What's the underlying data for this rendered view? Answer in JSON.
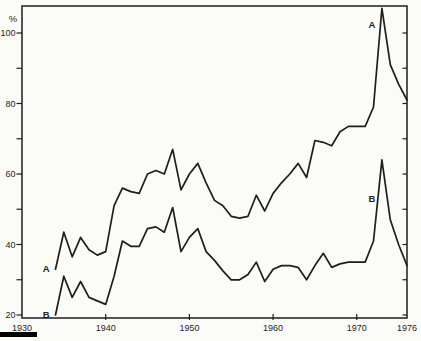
{
  "figure": {
    "background_color": "#fbfbf8",
    "ink_color": "#1e1e1e"
  },
  "chart_data": {
    "type": "line",
    "title": "",
    "xlabel": "",
    "ylabel": "%",
    "grid": false,
    "legend_position": "inline letters at series start and near 1973 peak",
    "x_axis": {
      "min": 1930,
      "max": 1976,
      "labeled_ticks": [
        1930,
        1940,
        1950,
        1960,
        1970,
        1976
      ],
      "tick_marks": [
        1940,
        1950,
        1960,
        1970
      ]
    },
    "y_axis": {
      "min": 20,
      "max": 107,
      "unit": "%",
      "labeled_ticks": [
        20,
        40,
        60,
        80,
        100
      ],
      "tick_marks": [
        20,
        30,
        40,
        50,
        60,
        70,
        80,
        90,
        100
      ]
    },
    "series": [
      {
        "name": "A",
        "color": "#1e1e1e",
        "annotations": [
          {
            "text": "A",
            "year": 1932.9,
            "value": 32.2
          },
          {
            "text": "A",
            "year": 1971.8,
            "value": 101.4
          }
        ],
        "points": [
          [
            1934,
            33
          ],
          [
            1935,
            43.5
          ],
          [
            1936,
            36.5
          ],
          [
            1937,
            42
          ],
          [
            1938,
            38.5
          ],
          [
            1939,
            37
          ],
          [
            1940,
            38
          ],
          [
            1941,
            51
          ],
          [
            1942,
            56
          ],
          [
            1943,
            55
          ],
          [
            1944,
            54.5
          ],
          [
            1945,
            60
          ],
          [
            1946,
            61
          ],
          [
            1947,
            60
          ],
          [
            1948,
            67
          ],
          [
            1949,
            55.5
          ],
          [
            1950,
            60
          ],
          [
            1951,
            63
          ],
          [
            1952,
            57.5
          ],
          [
            1953,
            52.5
          ],
          [
            1954,
            51
          ],
          [
            1955,
            48
          ],
          [
            1956,
            47.5
          ],
          [
            1957,
            48
          ],
          [
            1958,
            54
          ],
          [
            1959,
            49.5
          ],
          [
            1960,
            54.5
          ],
          [
            1961,
            57.5
          ],
          [
            1962,
            60
          ],
          [
            1963,
            63
          ],
          [
            1964,
            59
          ],
          [
            1965,
            69.5
          ],
          [
            1966,
            69
          ],
          [
            1967,
            68
          ],
          [
            1968,
            72
          ],
          [
            1969,
            73.5
          ],
          [
            1970,
            73.5
          ],
          [
            1971,
            73.5
          ],
          [
            1972,
            79
          ],
          [
            1973,
            107
          ],
          [
            1974,
            91
          ],
          [
            1975,
            85.5
          ],
          [
            1976,
            81
          ]
        ]
      },
      {
        "name": "B",
        "color": "#1e1e1e",
        "annotations": [
          {
            "text": "B",
            "year": 1932.9,
            "value": 19.1
          },
          {
            "text": "B",
            "year": 1971.8,
            "value": 52.1
          }
        ],
        "points": [
          [
            1934,
            20
          ],
          [
            1935,
            31
          ],
          [
            1936,
            25
          ],
          [
            1937,
            29.5
          ],
          [
            1938,
            25
          ],
          [
            1939,
            24
          ],
          [
            1940,
            23
          ],
          [
            1941,
            31
          ],
          [
            1942,
            41
          ],
          [
            1943,
            39.5
          ],
          [
            1944,
            39.5
          ],
          [
            1945,
            44.5
          ],
          [
            1946,
            45
          ],
          [
            1947,
            43.5
          ],
          [
            1948,
            50.5
          ],
          [
            1949,
            38
          ],
          [
            1950,
            42
          ],
          [
            1951,
            44.5
          ],
          [
            1952,
            38
          ],
          [
            1953,
            35.5
          ],
          [
            1954,
            32.5
          ],
          [
            1955,
            30
          ],
          [
            1956,
            30
          ],
          [
            1957,
            31.5
          ],
          [
            1958,
            35
          ],
          [
            1959,
            29.5
          ],
          [
            1960,
            33
          ],
          [
            1961,
            34
          ],
          [
            1962,
            34
          ],
          [
            1963,
            33.5
          ],
          [
            1964,
            30
          ],
          [
            1965,
            34
          ],
          [
            1966,
            37.5
          ],
          [
            1967,
            33.5
          ],
          [
            1968,
            34.5
          ],
          [
            1969,
            35
          ],
          [
            1970,
            35
          ],
          [
            1971,
            35
          ],
          [
            1972,
            41
          ],
          [
            1973,
            64
          ],
          [
            1974,
            47
          ],
          [
            1975,
            40
          ],
          [
            1976,
            34
          ]
        ]
      }
    ]
  },
  "decorations": {
    "corner_bar": {
      "description": "solid black printed bar at bottom-left page edge"
    }
  }
}
